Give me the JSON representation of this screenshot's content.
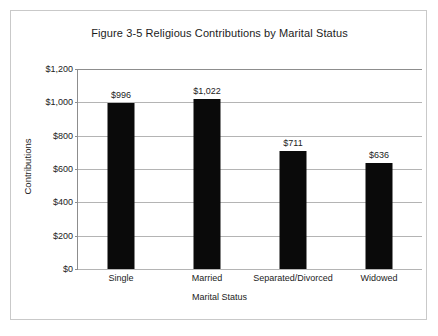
{
  "figure": {
    "title": "Figure 3-5 Religious Contributions by Marital Status"
  },
  "chart_data": {
    "type": "bar",
    "title": "Figure 3-5 Religious Contributions by Marital Status",
    "xlabel": "Marital Status",
    "ylabel": "Contributions",
    "categories": [
      "Single",
      "Married",
      "Separated/Divorced",
      "Widowed"
    ],
    "values": [
      996,
      1022,
      711,
      636
    ],
    "value_labels": [
      "$996",
      "$1,022",
      "$711",
      "$636"
    ],
    "ylim": [
      0,
      1200
    ],
    "ytick_values": [
      1200,
      1000,
      800,
      600,
      400,
      200,
      0
    ],
    "ytick_labels": [
      "$1,200",
      "$1,000",
      "$800",
      "$600",
      "$400",
      "$200",
      "$0"
    ],
    "grid": true,
    "legend": null,
    "bar_color": "#0a0a0a",
    "gridline_color": "#b4b4b4",
    "axis_color": "#8d8d8d",
    "background_color": "#ffffff",
    "border_color": "#c9c9c9"
  }
}
